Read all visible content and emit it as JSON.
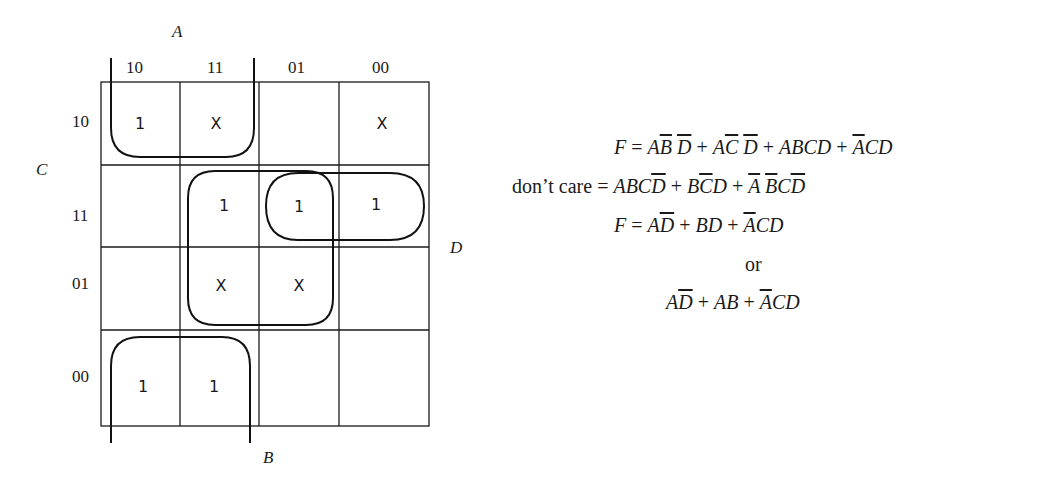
{
  "kmap": {
    "axis_labels": {
      "A": "A",
      "B": "B",
      "C": "C",
      "D": "D"
    },
    "column_headers": [
      "10",
      "11",
      "01",
      "00"
    ],
    "row_headers": [
      "10",
      "11",
      "01",
      "00"
    ],
    "cells": [
      [
        "1",
        "X",
        "",
        "X"
      ],
      [
        "",
        "1",
        "1",
        "1"
      ],
      [
        "",
        "X",
        "X",
        ""
      ],
      [
        "1",
        "1",
        "",
        ""
      ]
    ],
    "groupings": [
      "Top-left: row 10, columns 10 & 11 (open at top, wraps)",
      "Center square: rows 11 & 01, columns 11 & 01",
      "Horizontal: row 11, columns 01 & 00",
      "Bottom-left: row 00, columns 10 & 11 (open at bottom, wraps)"
    ]
  },
  "equations": {
    "line1": {
      "lhs": "F",
      "eq": "=",
      "terms": [
        "AB̄D̄",
        "AC̄D̄",
        "ABCD",
        "ĀCD"
      ]
    },
    "line2": {
      "lhs": "don’t care",
      "eq": "=",
      "terms": [
        "ABCD̄",
        "BC̄D",
        "ĀB̄CD̄"
      ]
    },
    "line3": {
      "lhs": "F",
      "eq": "=",
      "terms": [
        "AD̄",
        "BD",
        "ĀCD"
      ]
    },
    "line4": {
      "text": "or"
    },
    "line5": {
      "terms": [
        "AD̄",
        "AB",
        "ĀCD"
      ]
    }
  }
}
